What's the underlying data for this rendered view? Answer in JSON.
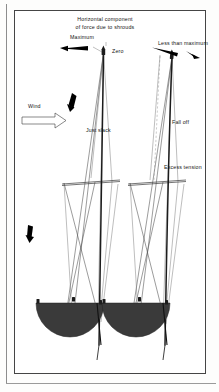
{
  "figure": {
    "title_line1": "Horizontal component",
    "title_line2": "of force due to shrouds",
    "labels": {
      "maximum": "Maximum",
      "zero": "Zero",
      "less_than_maximum": "Less than maximum",
      "wind": "Wind",
      "just_slack": "Just slack",
      "fall_off": "Fall off",
      "excess_tension": "Excess tension"
    },
    "icons": {
      "force_arrow_left": "solid-arrow-icon",
      "force_arrow_right": "solid-arrow-icon",
      "wind_arrow": "wind-arrow-icon",
      "shroud_load_arrow_upper": "solid-arrow-icon",
      "shroud_load_arrow_lower": "solid-arrow-icon",
      "masthead_fitting": "masthead-fitting-icon"
    },
    "colors": {
      "hull": "#3a3a3a",
      "mast": "#1c1c1c",
      "shroud": "#4a4a4a",
      "frame": "#454545",
      "arrow": "#000000",
      "background": "#ffffff"
    }
  }
}
